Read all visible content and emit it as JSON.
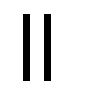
{
  "control": {
    "icon": "pause-icon",
    "label": "Pause",
    "color": "#000000",
    "background": "#ffffff"
  }
}
